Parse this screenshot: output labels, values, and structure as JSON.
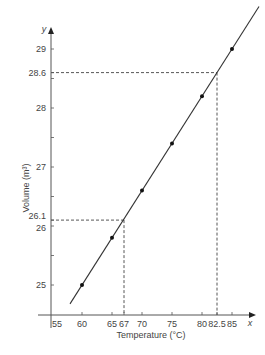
{
  "chart_data": {
    "type": "line",
    "title": "",
    "xlabel": "Temperature (°C)",
    "ylabel": "Volume (m³)",
    "x_axis_letter": "x",
    "y_axis_letter": "y",
    "xlim": [
      55,
      88
    ],
    "ylim": [
      24.5,
      29.5
    ],
    "x_ticks": [
      55,
      60,
      65,
      67,
      70,
      75,
      80,
      82.5,
      85
    ],
    "x_tick_labels": [
      "55",
      "60",
      "65",
      "67",
      "70",
      "75",
      "80",
      "82.5",
      "85"
    ],
    "y_ticks": [
      25,
      26,
      26.1,
      27,
      28,
      28.6,
      29
    ],
    "y_tick_labels": [
      "25",
      "26",
      "26.1",
      "27",
      "28",
      "28.6",
      "29"
    ],
    "y_minor_ticks": [
      25.5,
      26.5,
      27.5,
      28.5
    ],
    "grid": false,
    "series": [
      {
        "name": "measured",
        "x": [
          60,
          65,
          70,
          75,
          80,
          85
        ],
        "y": [
          25.0,
          25.8,
          26.6,
          27.4,
          28.2,
          29.0
        ],
        "marker": "dot"
      }
    ],
    "fit_line": {
      "x": [
        58,
        89.5
      ],
      "y": [
        24.68,
        29.72
      ]
    },
    "annotations": [
      {
        "x": 67,
        "y": 26.1,
        "style": "dashed"
      },
      {
        "x": 82.5,
        "y": 28.6,
        "style": "dashed"
      }
    ],
    "colors": {
      "line": "#333333",
      "axis": "#555555",
      "text": "#444444"
    }
  }
}
